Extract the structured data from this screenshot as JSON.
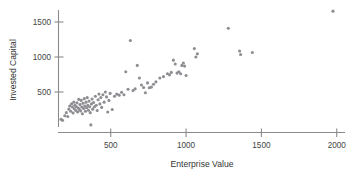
{
  "chart_data": {
    "type": "scatter",
    "title": "",
    "xlabel": "Enterprise Value",
    "ylabel": "Invested Capital",
    "xlim": [
      130,
      2080
    ],
    "ylim": [
      0,
      1760
    ],
    "xticks": [
      500,
      1000,
      1500,
      2000
    ],
    "xtick_labels": [
      "500",
      "1000",
      "1500",
      "2000"
    ],
    "yticks": [
      500,
      1000,
      1500
    ],
    "ytick_labels": [
      "500",
      "1000",
      "1500"
    ],
    "grid": false,
    "legend": false,
    "marker": "circle",
    "marker_color": "#8d8d92",
    "marker_size": 2.0,
    "n_points": 103,
    "points": [
      [
        170,
        110
      ],
      [
        180,
        95
      ],
      [
        195,
        160
      ],
      [
        205,
        205
      ],
      [
        215,
        150
      ],
      [
        222,
        255
      ],
      [
        228,
        300
      ],
      [
        235,
        225
      ],
      [
        240,
        330
      ],
      [
        246,
        285
      ],
      [
        250,
        200
      ],
      [
        255,
        355
      ],
      [
        258,
        260
      ],
      [
        262,
        310
      ],
      [
        268,
        235
      ],
      [
        272,
        290
      ],
      [
        276,
        345
      ],
      [
        280,
        215
      ],
      [
        285,
        270
      ],
      [
        288,
        395
      ],
      [
        292,
        250
      ],
      [
        296,
        320
      ],
      [
        300,
        230
      ],
      [
        304,
        380
      ],
      [
        308,
        285
      ],
      [
        312,
        190
      ],
      [
        316,
        340
      ],
      [
        320,
        265
      ],
      [
        324,
        405
      ],
      [
        328,
        300
      ],
      [
        332,
        225
      ],
      [
        336,
        355
      ],
      [
        340,
        275
      ],
      [
        344,
        420
      ],
      [
        348,
        310
      ],
      [
        352,
        240
      ],
      [
        356,
        370
      ],
      [
        360,
        290
      ],
      [
        364,
        205
      ],
      [
        368,
        30
      ],
      [
        372,
        330
      ],
      [
        376,
        400
      ],
      [
        380,
        255
      ],
      [
        386,
        350
      ],
      [
        392,
        290
      ],
      [
        398,
        440
      ],
      [
        404,
        310
      ],
      [
        410,
        235
      ],
      [
        416,
        390
      ],
      [
        422,
        470
      ],
      [
        428,
        330
      ],
      [
        434,
        420
      ],
      [
        440,
        280
      ],
      [
        448,
        460
      ],
      [
        456,
        355
      ],
      [
        464,
        500
      ],
      [
        472,
        430
      ],
      [
        480,
        215
      ],
      [
        488,
        380
      ],
      [
        496,
        480
      ],
      [
        510,
        250
      ],
      [
        525,
        440
      ],
      [
        540,
        470
      ],
      [
        556,
        455
      ],
      [
        572,
        495
      ],
      [
        588,
        460
      ],
      [
        600,
        790
      ],
      [
        615,
        540
      ],
      [
        630,
        1235
      ],
      [
        648,
        520
      ],
      [
        662,
        545
      ],
      [
        676,
        880
      ],
      [
        690,
        700
      ],
      [
        704,
        600
      ],
      [
        718,
        565
      ],
      [
        730,
        490
      ],
      [
        744,
        630
      ],
      [
        756,
        560
      ],
      [
        770,
        570
      ],
      [
        784,
        610
      ],
      [
        800,
        645
      ],
      [
        826,
        700
      ],
      [
        850,
        720
      ],
      [
        876,
        760
      ],
      [
        890,
        745
      ],
      [
        902,
        780
      ],
      [
        916,
        955
      ],
      [
        928,
        900
      ],
      [
        940,
        770
      ],
      [
        952,
        790
      ],
      [
        964,
        760
      ],
      [
        972,
        880
      ],
      [
        982,
        915
      ],
      [
        990,
        870
      ],
      [
        1000,
        735
      ],
      [
        1055,
        1120
      ],
      [
        1065,
        1000
      ],
      [
        1075,
        1045
      ],
      [
        1280,
        1410
      ],
      [
        1355,
        1085
      ],
      [
        1362,
        1035
      ],
      [
        1440,
        1065
      ],
      [
        1975,
        1655
      ]
    ]
  },
  "axes": {
    "x_axis_name": "x-axis",
    "y_axis_name": "y-axis"
  }
}
